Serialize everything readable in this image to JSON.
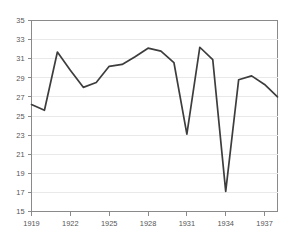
{
  "chart_data": {
    "type": "line",
    "title": "",
    "subtitle": "",
    "xlabel": "",
    "ylabel": "",
    "xlim": [
      1919,
      1938
    ],
    "ylim": [
      15,
      35
    ],
    "grid": true,
    "legend": false,
    "legend_position": "none",
    "line_color": "#3d3d3d",
    "grid_color": "#e9e9ec",
    "axis_color": "#8a8a8a",
    "label_color": "#555555",
    "background_color": "#ffffff",
    "x": [
      1919,
      1920,
      1921,
      1922,
      1923,
      1924,
      1925,
      1926,
      1927,
      1928,
      1929,
      1930,
      1931,
      1932,
      1933,
      1934,
      1935,
      1936,
      1937,
      1938
    ],
    "values": [
      26.2,
      25.6,
      31.7,
      29.8,
      28.0,
      28.5,
      30.2,
      30.4,
      31.2,
      32.1,
      31.8,
      30.6,
      23.1,
      32.2,
      30.9,
      17.1,
      28.8,
      29.2,
      28.3,
      27.0
    ],
    "categories": [
      "1919",
      "1920",
      "1921",
      "1922",
      "1923",
      "1924",
      "1925",
      "1926",
      "1927",
      "1928",
      "1929",
      "1930",
      "1931",
      "1932",
      "1933",
      "1934",
      "1935",
      "1936",
      "1937",
      "1938"
    ],
    "ytick_labels": [
      "35",
      "33",
      "31",
      "29",
      "27",
      "25",
      "23",
      "21",
      "19",
      "17",
      "15"
    ],
    "ytick_values": [
      35,
      33,
      31,
      29,
      27,
      25,
      23,
      21,
      19,
      17,
      15
    ],
    "xtick_labels": [
      "1919",
      "1922",
      "1925",
      "1928",
      "1931",
      "1934",
      "1937"
    ],
    "xtick_values": [
      1919,
      1922,
      1925,
      1928,
      1931,
      1934,
      1937
    ]
  }
}
